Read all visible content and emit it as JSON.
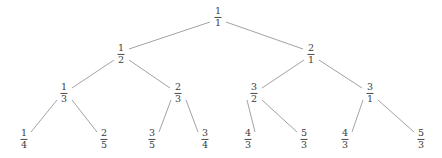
{
  "figure": {
    "name": "fraction-binary-tree",
    "background_color": "#ffffff",
    "text_color": "#3a3a3a",
    "edge_color": "#8a8a8a"
  },
  "chart_data": {
    "type": "diagram",
    "title": "",
    "levels": 4,
    "nodes": [
      {
        "id": "n0",
        "numerator": "1",
        "denominator": "1",
        "level": 0,
        "x": 218,
        "y": 17
      },
      {
        "id": "n0L",
        "numerator": "1",
        "denominator": "2",
        "level": 1,
        "x": 121,
        "y": 54
      },
      {
        "id": "n0R",
        "numerator": "2",
        "denominator": "1",
        "level": 1,
        "x": 311,
        "y": 54
      },
      {
        "id": "n0LL",
        "numerator": "1",
        "denominator": "3",
        "level": 2,
        "x": 64,
        "y": 93
      },
      {
        "id": "n0LR",
        "numerator": "2",
        "denominator": "3",
        "level": 2,
        "x": 178,
        "y": 93
      },
      {
        "id": "n0RL",
        "numerator": "3",
        "denominator": "2",
        "level": 2,
        "x": 254,
        "y": 93
      },
      {
        "id": "n0RR",
        "numerator": "3",
        "denominator": "1",
        "level": 2,
        "x": 370,
        "y": 93
      },
      {
        "id": "n0LLL",
        "numerator": "1",
        "denominator": "4",
        "level": 3,
        "x": 24,
        "y": 139
      },
      {
        "id": "n0LLR",
        "numerator": "2",
        "denominator": "5",
        "level": 3,
        "x": 104,
        "y": 139
      },
      {
        "id": "n0LRL",
        "numerator": "3",
        "denominator": "5",
        "level": 3,
        "x": 152,
        "y": 139
      },
      {
        "id": "n0LRR",
        "numerator": "3",
        "denominator": "4",
        "level": 3,
        "x": 205,
        "y": 139
      },
      {
        "id": "n0RLL",
        "numerator": "4",
        "denominator": "3",
        "level": 3,
        "x": 248,
        "y": 139
      },
      {
        "id": "n0RLR",
        "numerator": "5",
        "denominator": "3",
        "level": 3,
        "x": 304,
        "y": 139
      },
      {
        "id": "n0RRL",
        "numerator": "4",
        "denominator": "3",
        "level": 3,
        "x": 345,
        "y": 139
      },
      {
        "id": "n0RRR",
        "numerator": "5",
        "denominator": "3",
        "level": 3,
        "x": 421,
        "y": 139
      }
    ],
    "edges": [
      {
        "from": "n0",
        "to": "n0L",
        "x1": 210,
        "y1": 22,
        "x2": 129,
        "y2": 49
      },
      {
        "from": "n0",
        "to": "n0R",
        "x1": 226,
        "y1": 22,
        "x2": 303,
        "y2": 49
      },
      {
        "from": "n0L",
        "to": "n0LL",
        "x1": 114,
        "y1": 60,
        "x2": 72,
        "y2": 88
      },
      {
        "from": "n0L",
        "to": "n0LR",
        "x1": 129,
        "y1": 60,
        "x2": 170,
        "y2": 88
      },
      {
        "from": "n0R",
        "to": "n0RL",
        "x1": 304,
        "y1": 60,
        "x2": 262,
        "y2": 88
      },
      {
        "from": "n0R",
        "to": "n0RR",
        "x1": 319,
        "y1": 60,
        "x2": 362,
        "y2": 88
      },
      {
        "from": "n0LL",
        "to": "n0LLL",
        "x1": 57,
        "y1": 100,
        "x2": 31,
        "y2": 132
      },
      {
        "from": "n0LL",
        "to": "n0LLR",
        "x1": 72,
        "y1": 100,
        "x2": 97,
        "y2": 132
      },
      {
        "from": "n0LR",
        "to": "n0LRL",
        "x1": 171,
        "y1": 100,
        "x2": 159,
        "y2": 132
      },
      {
        "from": "n0LR",
        "to": "n0LRR",
        "x1": 186,
        "y1": 100,
        "x2": 198,
        "y2": 132
      },
      {
        "from": "n0RL",
        "to": "n0RLL",
        "x1": 247,
        "y1": 100,
        "x2": 255,
        "y2": 132
      },
      {
        "from": "n0RL",
        "to": "n0RLR",
        "x1": 262,
        "y1": 100,
        "x2": 297,
        "y2": 132
      },
      {
        "from": "n0RR",
        "to": "n0RRL",
        "x1": 363,
        "y1": 100,
        "x2": 352,
        "y2": 132
      },
      {
        "from": "n0RR",
        "to": "n0RRR",
        "x1": 378,
        "y1": 100,
        "x2": 414,
        "y2": 132
      }
    ]
  }
}
